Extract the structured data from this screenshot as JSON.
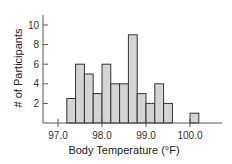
{
  "chart_data": {
    "type": "bar",
    "title": "",
    "xlabel": "Body Temperature (°F)",
    "ylabel": "# of Participants",
    "bin_width": 0.2,
    "bins": [
      {
        "start": 97.2,
        "end": 97.4,
        "count": 2.5
      },
      {
        "start": 97.4,
        "end": 97.6,
        "count": 6
      },
      {
        "start": 97.6,
        "end": 97.8,
        "count": 5
      },
      {
        "start": 97.8,
        "end": 98.0,
        "count": 3
      },
      {
        "start": 98.0,
        "end": 98.2,
        "count": 6
      },
      {
        "start": 98.2,
        "end": 98.4,
        "count": 4
      },
      {
        "start": 98.4,
        "end": 98.6,
        "count": 4
      },
      {
        "start": 98.6,
        "end": 98.8,
        "count": 9
      },
      {
        "start": 98.8,
        "end": 99.0,
        "count": 3
      },
      {
        "start": 99.0,
        "end": 99.2,
        "count": 2
      },
      {
        "start": 99.2,
        "end": 99.4,
        "count": 4
      },
      {
        "start": 99.4,
        "end": 99.6,
        "count": 2
      },
      {
        "start": 100.0,
        "end": 100.2,
        "count": 1
      }
    ],
    "x_ticks": [
      "97.0",
      "98.0",
      "99.0",
      "100.0"
    ],
    "y_ticks": [
      "2",
      "4",
      "6",
      "8",
      "10"
    ],
    "xlim": [
      96.7,
      100.7
    ],
    "ylim": [
      0,
      10.5
    ],
    "grid": false,
    "legend": null
  },
  "colors": {
    "bar_fill": "#d4d4d4",
    "bar_stroke": "#333333",
    "axis": "#555555"
  }
}
